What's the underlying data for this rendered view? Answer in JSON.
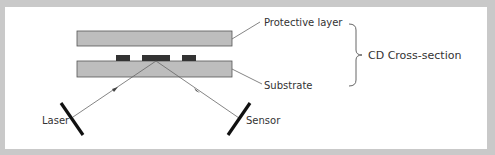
{
  "diagram": {
    "title": "CD Cross-section",
    "labels": {
      "protective_layer": "Protective layer",
      "substrate": "Substrate",
      "group": "CD Cross-section",
      "laser": "Laser",
      "sensor": "Sensor"
    },
    "colors": {
      "frame": "#c9c9c9",
      "panel": "#ffffff",
      "layer_fill": "#bdbdbd",
      "layer_stroke": "#555555",
      "pit": "#333333",
      "beam": "#666666",
      "device": "#111111",
      "text": "#333333"
    }
  }
}
